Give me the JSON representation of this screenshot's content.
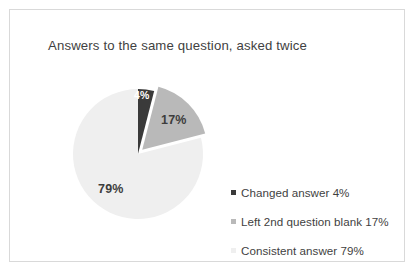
{
  "chart_data": {
    "type": "pie",
    "title": "Answers to the same question, asked twice",
    "categories": [
      "Changed answer",
      "Left 2nd question blank",
      "Consistent answer"
    ],
    "values": [
      4,
      17,
      79
    ],
    "value_labels": [
      "4%",
      "17%",
      "79%"
    ],
    "legend_labels": [
      "Changed answer 4%",
      "Left 2nd question blank 17%",
      "Consistent answer 79%"
    ],
    "colors": [
      "#3a3a3a",
      "#b9b9b9",
      "#efefef"
    ],
    "legend_position": "right",
    "start_angle_oclock": 12,
    "direction": "clockwise",
    "exploded_slices": [
      "Left 2nd question blank"
    ],
    "grid": false,
    "xlabel": "",
    "ylabel": ""
  },
  "geometry": {
    "center_x": 73,
    "center_y": 73,
    "radius": 65,
    "explode_offset": 6
  }
}
